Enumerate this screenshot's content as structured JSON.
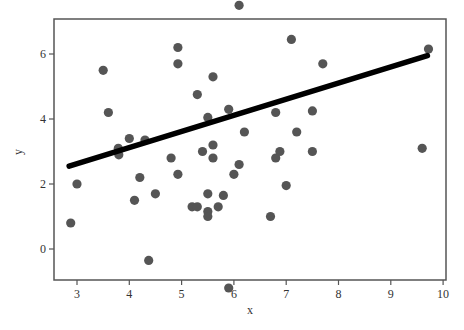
{
  "chart_data": {
    "type": "scatter",
    "title": "",
    "xlabel": "x",
    "ylabel": "y",
    "xlim": [
      2.6,
      10.05
    ],
    "ylim": [
      -1.9,
      14.2
    ],
    "grid": false,
    "legend": null,
    "x_ticks": [
      3,
      4,
      5,
      6,
      7,
      8,
      9,
      10
    ],
    "y_ticks": [
      0,
      2,
      4,
      6,
      8,
      10,
      12,
      14
    ],
    "point_color": "#555555",
    "line_color": "#000000",
    "series": [
      {
        "name": "observations",
        "kind": "scatter",
        "points": [
          [
            2.88,
            0.8
          ],
          [
            3.0,
            2.0
          ],
          [
            3.29,
            7.9
          ],
          [
            3.5,
            5.5
          ],
          [
            3.6,
            4.2
          ],
          [
            3.79,
            8.1
          ],
          [
            3.79,
            3.1
          ],
          [
            3.8,
            2.9
          ],
          [
            4.0,
            3.4
          ],
          [
            4.1,
            1.5
          ],
          [
            4.2,
            2.2
          ],
          [
            4.3,
            3.35
          ],
          [
            4.37,
            -0.35
          ],
          [
            4.5,
            1.7
          ],
          [
            4.8,
            2.8
          ],
          [
            4.93,
            6.2
          ],
          [
            4.93,
            5.7
          ],
          [
            4.93,
            2.3
          ],
          [
            5.2,
            1.3
          ],
          [
            5.3,
            1.3
          ],
          [
            5.3,
            4.75
          ],
          [
            5.4,
            3.0
          ],
          [
            5.5,
            4.05
          ],
          [
            5.5,
            1.7
          ],
          [
            5.5,
            1.15
          ],
          [
            5.5,
            1.0
          ],
          [
            5.6,
            5.3
          ],
          [
            5.6,
            3.2
          ],
          [
            5.6,
            2.8
          ],
          [
            5.63,
            10.9
          ],
          [
            5.7,
            1.3
          ],
          [
            5.8,
            1.65
          ],
          [
            5.84,
            11.2
          ],
          [
            5.9,
            4.3
          ],
          [
            5.9,
            -1.2
          ],
          [
            6.0,
            2.3
          ],
          [
            6.1,
            2.6
          ],
          [
            6.1,
            7.5
          ],
          [
            6.2,
            3.6
          ],
          [
            6.7,
            1.0
          ],
          [
            6.8,
            4.2
          ],
          [
            6.8,
            2.8
          ],
          [
            6.88,
            3.0
          ],
          [
            7.0,
            1.95
          ],
          [
            7.1,
            6.45
          ],
          [
            7.1,
            13.4
          ],
          [
            7.2,
            3.6
          ],
          [
            7.5,
            4.25
          ],
          [
            7.5,
            3.0
          ],
          [
            7.62,
            10.2
          ],
          [
            7.7,
            5.7
          ],
          [
            8.53,
            9.0
          ],
          [
            9.6,
            3.1
          ],
          [
            9.72,
            6.15
          ]
        ]
      },
      {
        "name": "fitted line",
        "kind": "line",
        "x": [
          2.85,
          9.7
        ],
        "y": [
          2.55,
          5.95
        ]
      }
    ]
  }
}
